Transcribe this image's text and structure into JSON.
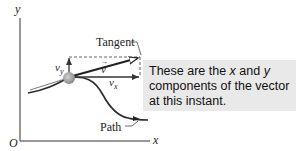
{
  "diagram": {
    "axes": {
      "origin_label": "O",
      "x_label": "x",
      "y_label": "y"
    },
    "labels": {
      "tangent": "Tangent",
      "path": "Path",
      "velocity": "v",
      "velocity_arrow": "→",
      "vx_main": "v",
      "vx_sub": "x",
      "vy_main": "v",
      "vy_sub": "y"
    },
    "callout": {
      "line1_a": "These are the ",
      "line1_x": "x",
      "line1_b": " and ",
      "line1_y": "y",
      "line2": "components of the vector",
      "line3": "at this instant."
    },
    "colors": {
      "axis": "#333333",
      "path": "#2a2a2a",
      "particle": "#9a9a9a",
      "callout_bg": "#e9e9e9",
      "dashed": "#555555"
    }
  }
}
